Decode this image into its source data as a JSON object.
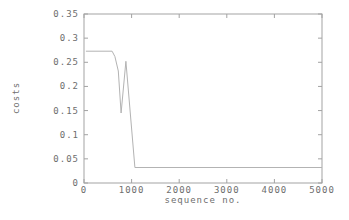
{
  "figure": {
    "background": "#ffffff"
  },
  "chart_data": {
    "type": "line",
    "title": "",
    "xlabel": "sequence no.",
    "ylabel": "costs",
    "xlim": [
      0,
      5000
    ],
    "ylim": [
      0,
      0.35
    ],
    "grid": false,
    "legend": "none",
    "x_ticks": [
      0,
      1000,
      2000,
      3000,
      4000,
      5000
    ],
    "x_tick_labels": [
      "0",
      "1000",
      "2000",
      "3000",
      "4000",
      "5000"
    ],
    "y_ticks": [
      0,
      0.05,
      0.1,
      0.15,
      0.2,
      0.25,
      0.3,
      0.35
    ],
    "y_tick_labels": [
      "0",
      "0.05",
      "0.1",
      "0.15",
      "0.2",
      "0.25",
      "0.3",
      "0.35"
    ],
    "axis_color": "#a3a3a3",
    "text_color": "#6e6e6e",
    "series": [
      {
        "name": "costs",
        "color": "#b3b3b3",
        "points": [
          [
            40,
            0.273
          ],
          [
            590,
            0.273
          ],
          [
            650,
            0.262
          ],
          [
            720,
            0.232
          ],
          [
            780,
            0.145
          ],
          [
            880,
            0.252
          ],
          [
            1070,
            0.032
          ],
          [
            5000,
            0.032
          ]
        ]
      }
    ]
  }
}
